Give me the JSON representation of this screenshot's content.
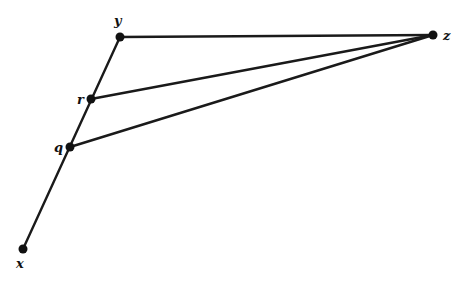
{
  "diagram": {
    "type": "geometric-graph",
    "nodes": [
      {
        "id": "y",
        "label": "y",
        "x": 120,
        "y": 37,
        "lx": 114,
        "ly": 25
      },
      {
        "id": "r",
        "label": "r",
        "x": 91,
        "y": 99,
        "lx": 77,
        "ly": 104
      },
      {
        "id": "q",
        "label": "q",
        "x": 70,
        "y": 147,
        "lx": 54,
        "ly": 152
      },
      {
        "id": "x",
        "label": "x",
        "x": 23,
        "y": 249,
        "lx": 16,
        "ly": 268
      },
      {
        "id": "z",
        "label": "z",
        "x": 433,
        "y": 35,
        "lx": 443,
        "ly": 40
      }
    ],
    "edges": [
      {
        "from": "x",
        "to": "y"
      },
      {
        "from": "y",
        "to": "z"
      },
      {
        "from": "r",
        "to": "z"
      },
      {
        "from": "q",
        "to": "z"
      }
    ],
    "colors": {
      "line": "#1a1a1a",
      "node": "#111111",
      "background": "#ffffff"
    }
  }
}
